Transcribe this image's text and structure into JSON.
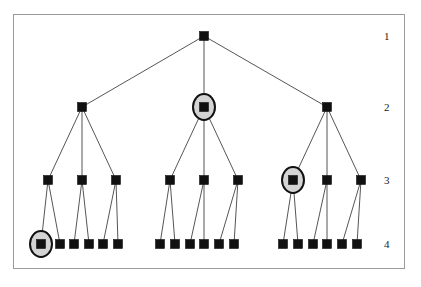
{
  "figure": {
    "frame": {
      "x": 13.5,
      "y": 14.5,
      "width": 391,
      "height": 254,
      "stroke_color": "#9a9a9a",
      "stroke_width": 1,
      "fill_color": "#ffffff"
    },
    "node_style": {
      "fill_color": "#111111",
      "stroke_color": "#111111",
      "size": 9
    },
    "edge_style": {
      "stroke_color": "#2a2a2a",
      "stroke_width": 0.8
    },
    "highlight_style": {
      "fill_color": "#d4d4d4",
      "stroke_color": "#111111",
      "stroke_width": 2,
      "rx": 11,
      "ry": 13
    }
  },
  "level_labels": [
    {
      "id": "level-1",
      "text": "1",
      "x": 384,
      "y": 31
    },
    {
      "id": "level-2",
      "text": "2",
      "x": 384,
      "y": 102
    },
    {
      "id": "level-3",
      "text": "3",
      "x": 384,
      "y": 175
    },
    {
      "id": "level-4",
      "text": "4",
      "x": 384,
      "y": 239
    }
  ],
  "levels": [
    {
      "index": 1,
      "y": 36
    },
    {
      "index": 2,
      "y": 107
    },
    {
      "index": 3,
      "y": 180
    },
    {
      "index": 4,
      "y": 244
    }
  ],
  "nodes": [
    {
      "id": "n1",
      "label": "root",
      "level": 1,
      "x": 204,
      "y": 36,
      "highlighted": false
    },
    {
      "id": "n2-1",
      "label": "branch-left",
      "level": 2,
      "x": 82,
      "y": 107,
      "highlighted": false
    },
    {
      "id": "n2-2",
      "label": "branch-middle",
      "level": 2,
      "x": 204,
      "y": 107,
      "highlighted": true
    },
    {
      "id": "n2-3",
      "label": "branch-right",
      "level": 2,
      "x": 327,
      "y": 107,
      "highlighted": false
    },
    {
      "id": "n3-1",
      "label": "sub-left-1",
      "level": 3,
      "x": 48,
      "y": 180,
      "highlighted": false
    },
    {
      "id": "n3-2",
      "label": "sub-left-2",
      "level": 3,
      "x": 82,
      "y": 180,
      "highlighted": false
    },
    {
      "id": "n3-3",
      "label": "sub-left-3",
      "level": 3,
      "x": 116,
      "y": 180,
      "highlighted": false
    },
    {
      "id": "n3-4",
      "label": "sub-middle-1",
      "level": 3,
      "x": 170,
      "y": 180,
      "highlighted": false
    },
    {
      "id": "n3-5",
      "label": "sub-middle-2",
      "level": 3,
      "x": 204,
      "y": 180,
      "highlighted": false
    },
    {
      "id": "n3-6",
      "label": "sub-middle-3",
      "level": 3,
      "x": 238,
      "y": 180,
      "highlighted": false
    },
    {
      "id": "n3-7",
      "label": "sub-right-1",
      "level": 3,
      "x": 293,
      "y": 180,
      "highlighted": true
    },
    {
      "id": "n3-8",
      "label": "sub-right-2",
      "level": 3,
      "x": 327,
      "y": 180,
      "highlighted": false
    },
    {
      "id": "n3-9",
      "label": "sub-right-3",
      "level": 3,
      "x": 361,
      "y": 180,
      "highlighted": false
    },
    {
      "id": "n4-1",
      "label": "leaf-1",
      "level": 4,
      "x": 41,
      "y": 244,
      "highlighted": true
    },
    {
      "id": "n4-2",
      "label": "leaf-2",
      "level": 4,
      "x": 60,
      "y": 244,
      "highlighted": false
    },
    {
      "id": "n4-3",
      "label": "leaf-3",
      "level": 4,
      "x": 74,
      "y": 244,
      "highlighted": false
    },
    {
      "id": "n4-4",
      "label": "leaf-4",
      "level": 4,
      "x": 89,
      "y": 244,
      "highlighted": false
    },
    {
      "id": "n4-5",
      "label": "leaf-5",
      "level": 4,
      "x": 103,
      "y": 244,
      "highlighted": false
    },
    {
      "id": "n4-6",
      "label": "leaf-6",
      "level": 4,
      "x": 118,
      "y": 244,
      "highlighted": false
    },
    {
      "id": "n4-7",
      "label": "leaf-7",
      "level": 4,
      "x": 160,
      "y": 244,
      "highlighted": false
    },
    {
      "id": "n4-8",
      "label": "leaf-8",
      "level": 4,
      "x": 175,
      "y": 244,
      "highlighted": false
    },
    {
      "id": "n4-9",
      "label": "leaf-9",
      "level": 4,
      "x": 190,
      "y": 244,
      "highlighted": false
    },
    {
      "id": "n4-10",
      "label": "leaf-10",
      "level": 4,
      "x": 204,
      "y": 244,
      "highlighted": false
    },
    {
      "id": "n4-11",
      "label": "leaf-11",
      "level": 4,
      "x": 219,
      "y": 244,
      "highlighted": false
    },
    {
      "id": "n4-12",
      "label": "leaf-12",
      "level": 4,
      "x": 234,
      "y": 244,
      "highlighted": false
    },
    {
      "id": "n4-13",
      "label": "leaf-13",
      "level": 4,
      "x": 283,
      "y": 244,
      "highlighted": false
    },
    {
      "id": "n4-14",
      "label": "leaf-14",
      "level": 4,
      "x": 298,
      "y": 244,
      "highlighted": false
    },
    {
      "id": "n4-15",
      "label": "leaf-15",
      "level": 4,
      "x": 313,
      "y": 244,
      "highlighted": false
    },
    {
      "id": "n4-16",
      "label": "leaf-16",
      "level": 4,
      "x": 327,
      "y": 244,
      "highlighted": false
    },
    {
      "id": "n4-17",
      "label": "leaf-17",
      "level": 4,
      "x": 342,
      "y": 244,
      "highlighted": false
    },
    {
      "id": "n4-18",
      "label": "leaf-18",
      "level": 4,
      "x": 357,
      "y": 244,
      "highlighted": false
    }
  ],
  "edges": [
    {
      "from": "n1",
      "to": "n2-1"
    },
    {
      "from": "n1",
      "to": "n2-2"
    },
    {
      "from": "n1",
      "to": "n2-3"
    },
    {
      "from": "n2-1",
      "to": "n3-1"
    },
    {
      "from": "n2-1",
      "to": "n3-2"
    },
    {
      "from": "n2-1",
      "to": "n3-3"
    },
    {
      "from": "n2-2",
      "to": "n3-4"
    },
    {
      "from": "n2-2",
      "to": "n3-5"
    },
    {
      "from": "n2-2",
      "to": "n3-6"
    },
    {
      "from": "n2-3",
      "to": "n3-7"
    },
    {
      "from": "n2-3",
      "to": "n3-8"
    },
    {
      "from": "n2-3",
      "to": "n3-9"
    },
    {
      "from": "n3-1",
      "to": "n4-1"
    },
    {
      "from": "n3-1",
      "to": "n4-2"
    },
    {
      "from": "n3-2",
      "to": "n4-3"
    },
    {
      "from": "n3-2",
      "to": "n4-4"
    },
    {
      "from": "n3-3",
      "to": "n4-5"
    },
    {
      "from": "n3-3",
      "to": "n4-6"
    },
    {
      "from": "n3-4",
      "to": "n4-7"
    },
    {
      "from": "n3-4",
      "to": "n4-8"
    },
    {
      "from": "n3-5",
      "to": "n4-9"
    },
    {
      "from": "n3-5",
      "to": "n4-10"
    },
    {
      "from": "n3-6",
      "to": "n4-11"
    },
    {
      "from": "n3-6",
      "to": "n4-12"
    },
    {
      "from": "n3-7",
      "to": "n4-13"
    },
    {
      "from": "n3-7",
      "to": "n4-14"
    },
    {
      "from": "n3-8",
      "to": "n4-15"
    },
    {
      "from": "n3-8",
      "to": "n4-16"
    },
    {
      "from": "n3-9",
      "to": "n4-17"
    },
    {
      "from": "n3-9",
      "to": "n4-18"
    }
  ]
}
